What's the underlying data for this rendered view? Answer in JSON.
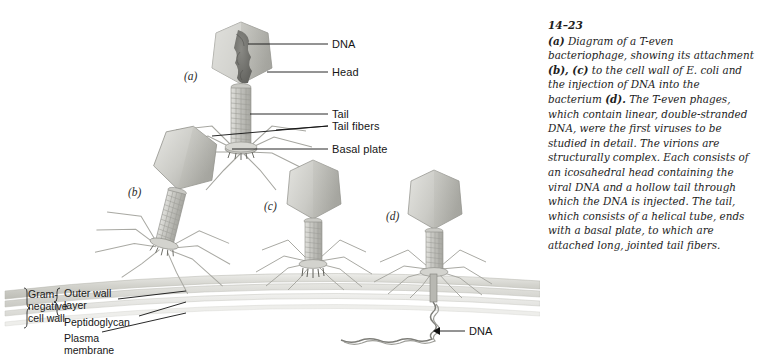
{
  "figure": {
    "number": "14–23",
    "caption_runs": [
      {
        "text": "(a)",
        "bold": true
      },
      {
        "text": " Diagram of a T-even bacteriophage, showing its attachment ",
        "bold": false
      },
      {
        "text": "(b), (c)",
        "bold": true
      },
      {
        "text": " to the cell wall of E. coli and the injection of DNA into the bacterium ",
        "bold": false
      },
      {
        "text": "(d).",
        "bold": true
      },
      {
        "text": " The T-even phages, which contain linear, double-stranded DNA, were the first viruses to be studied in detail. The virions are structurally complex. Each consists of an icosahedral head containing the viral DNA and a hollow tail through which the DNA is injected. The tail, which consists of a helical tube, ends with a basal plate, to which are attached long, jointed tail fibers.",
        "bold": false
      }
    ],
    "caption_plain": "(a) Diagram of a T-even bacteriophage, showing its attachment (b), (c) to the cell wall of E. coli and the injection of DNA into the bacterium (d). The T-even phages, which contain linear, double-stranded DNA, were the first viruses to be studied in detail. The virions are structurally complex. Each consists of an icosahedral head containing the viral DNA and a hollow tail through which the DNA is injected. The tail, which consists of a helical tube, ends with a basal plate, to which are attached long, jointed tail fibers."
  },
  "panels": {
    "a": "(a)",
    "b": "(b)",
    "c": "(c)",
    "d": "(d)"
  },
  "callouts": {
    "dna_head": "DNA",
    "head": "Head",
    "tail": "Tail",
    "tail_fibers": "Tail fibers",
    "basal_plate": "Basal plate",
    "dna_injected": "DNA"
  },
  "cell_wall": {
    "group_line1": "Gram-",
    "group_line2": "negative",
    "group_line3": "cell wall",
    "outer_wall_line1": "Outer wall",
    "outer_wall_line2": "layer",
    "peptidoglycan": "Peptidoglycan",
    "plasma_line1": "Plasma",
    "plasma_line2": "membrane"
  },
  "colors": {
    "background": "#ffffff",
    "head_light": "#d2d2cd",
    "head_mid": "#bdbdb7",
    "head_dark": "#a3a39d",
    "dna_mass": "#6e6e6a",
    "tail_tube": "#c4c4bf",
    "fiber": "#9a9a95",
    "wall_band": "#d9d9d4",
    "leader_line": "#111111",
    "text": "#161616"
  }
}
